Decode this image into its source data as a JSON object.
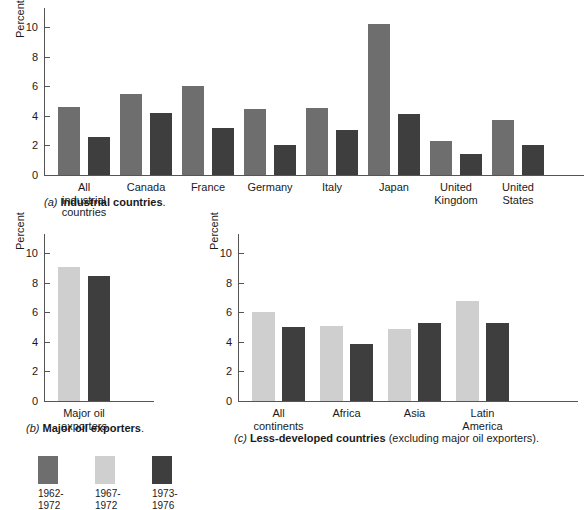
{
  "colors": {
    "series_1962_1972": "#6e6e6e",
    "series_1967_1972": "#cfcfcf",
    "series_1973_1976": "#3e3e3e",
    "axis": "#555555",
    "text": "#1a1a1a"
  },
  "legend": {
    "position": "bottom-left",
    "entries": [
      {
        "swatch": "#6e6e6e",
        "label": "1962-\n1972"
      },
      {
        "swatch": "#cfcfcf",
        "label": "1967-\n1972"
      },
      {
        "swatch": "#3e3e3e",
        "label": "1973-\n1976"
      }
    ]
  },
  "captions": {
    "a_letter": "(a)",
    "a_bold": "Industrial countries",
    "a_tail": ".",
    "b_letter": "(b)",
    "b_bold": "Major oil exporters",
    "b_tail": ".",
    "c_letter": "(c)",
    "c_bold": "Less-developed countries",
    "c_tail": " (excluding major oil exporters)."
  },
  "chart_data": [
    {
      "id": "a",
      "type": "bar",
      "title": "(a) Industrial countries.",
      "xlabel": "",
      "ylabel": "Percent",
      "ylim": [
        0,
        11.3
      ],
      "yticks": [
        0,
        2,
        4,
        6,
        8,
        10
      ],
      "ytick_labels": [
        "0",
        "2",
        "4",
        "6",
        "8",
        "10"
      ],
      "grid": false,
      "categories": [
        "All\nindustrial\ncountries",
        "Canada",
        "France",
        "Germany",
        "Italy",
        "Japan",
        "United\nKingdom",
        "United\nStates"
      ],
      "series": [
        {
          "name": "1962-1972",
          "color": "#6e6e6e",
          "values": [
            4.6,
            5.5,
            6.0,
            4.45,
            4.55,
            10.2,
            2.3,
            3.75
          ]
        },
        {
          "name": "1973-1976",
          "color": "#3e3e3e",
          "values": [
            2.55,
            4.2,
            3.2,
            2.05,
            3.05,
            4.15,
            1.4,
            2.05
          ]
        }
      ]
    },
    {
      "id": "b",
      "type": "bar",
      "title": "(b) Major oil exporters.",
      "xlabel": "",
      "ylabel": "Percent",
      "ylim": [
        0,
        11.3
      ],
      "yticks": [
        0,
        2,
        4,
        6,
        8,
        10
      ],
      "ytick_labels": [
        "0",
        "2",
        "4",
        "6",
        "8",
        "10"
      ],
      "grid": false,
      "categories": [
        "Major oil\nexporters"
      ],
      "series": [
        {
          "name": "1967-1972",
          "color": "#cfcfcf",
          "values": [
            9.05
          ]
        },
        {
          "name": "1973-1976",
          "color": "#3e3e3e",
          "values": [
            8.45
          ]
        }
      ]
    },
    {
      "id": "c",
      "type": "bar",
      "title": "(c) Less-developed countries (excluding major oil exporters).",
      "xlabel": "",
      "ylabel": "Percent",
      "ylim": [
        0,
        11.3
      ],
      "yticks": [
        0,
        2,
        4,
        6,
        8,
        10
      ],
      "ytick_labels": [
        "0",
        "2",
        "4",
        "6",
        "8",
        "10"
      ],
      "grid": false,
      "categories": [
        "All\ncontinents",
        "Africa",
        "Asia",
        "Latin\nAmerica"
      ],
      "series": [
        {
          "name": "1967-1972",
          "color": "#cfcfcf",
          "values": [
            6.05,
            5.05,
            4.85,
            6.75
          ]
        },
        {
          "name": "1973-1976",
          "color": "#3e3e3e",
          "values": [
            5.0,
            3.85,
            5.25,
            5.3
          ]
        }
      ]
    }
  ]
}
